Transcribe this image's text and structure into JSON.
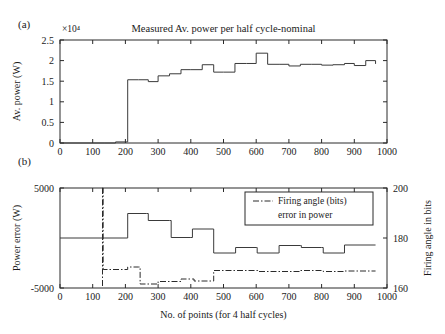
{
  "figure": {
    "panel_a_label": "(a)",
    "panel_b_label": "(b)"
  },
  "chart_data": [
    {
      "id": "panel_a",
      "type": "line",
      "title": "Measured Av. power per half cycle-nominal",
      "xlabel": "",
      "ylabel": "Av. power (W)",
      "y_exponent_label": "×10⁴",
      "xlim": [
        0,
        1000
      ],
      "ylim": [
        0,
        25000
      ],
      "xticks": [
        0,
        100,
        200,
        300,
        400,
        500,
        600,
        700,
        800,
        900,
        1000
      ],
      "xticklabels": [
        "0",
        "100",
        "200",
        "300",
        "400",
        "500",
        "600",
        "700",
        "800",
        "900",
        "1000"
      ],
      "yticks": [
        0,
        5000,
        10000,
        15000,
        20000,
        25000
      ],
      "yticklabels": [
        "0",
        "0.5",
        "1",
        "1.5",
        "2",
        "2.5"
      ],
      "grid": false,
      "legend": "none",
      "series": [
        {
          "name": "Measured Av. power",
          "style": "solid",
          "step": "post",
          "x": [
            0,
            135,
            170,
            205,
            207,
            240,
            270,
            300,
            335,
            370,
            400,
            435,
            470,
            500,
            535,
            570,
            600,
            635,
            670,
            700,
            735,
            770,
            800,
            835,
            870,
            900,
            935,
            965
          ],
          "y": [
            0,
            0,
            260,
            260,
            15350,
            15350,
            14900,
            16300,
            16800,
            17800,
            17800,
            19000,
            17200,
            17200,
            19300,
            19300,
            21800,
            19100,
            19100,
            18700,
            19100,
            19100,
            18900,
            19000,
            19300,
            18800,
            20000,
            19200
          ]
        }
      ]
    },
    {
      "id": "panel_b",
      "type": "line",
      "title": "",
      "xlabel": "No. of points (for 4 half cycles)",
      "ylabel": "Power error (W)",
      "ylabel_right": "Firing angle in bits",
      "xlim": [
        0,
        1000
      ],
      "ylim": [
        -5000,
        5000
      ],
      "ylim_right": [
        160,
        200
      ],
      "xticks": [
        0,
        100,
        200,
        300,
        400,
        500,
        600,
        700,
        800,
        900,
        1000
      ],
      "xticklabels": [
        "0",
        "100",
        "200",
        "300",
        "400",
        "500",
        "600",
        "700",
        "800",
        "900",
        "1000"
      ],
      "yticks": [
        -5000,
        5000
      ],
      "yticklabels": [
        "-5000",
        "5000"
      ],
      "yticks_right": [
        160,
        180,
        200
      ],
      "yticklabels_right": [
        "160",
        "180",
        "200"
      ],
      "grid": false,
      "legend": {
        "position": "top-right",
        "entries": [
          {
            "label_line1": "Firing angle (bits)",
            "label_line2": "error in power",
            "style": "dashdot"
          }
        ]
      },
      "series": [
        {
          "name": "error in power",
          "axis": "left",
          "style": "solid",
          "step": "post",
          "x": [
            0,
            135,
            205,
            207,
            265,
            270,
            335,
            340,
            400,
            405,
            468,
            470,
            535,
            537,
            600,
            603,
            668,
            670,
            735,
            738,
            800,
            805,
            868,
            870,
            965
          ],
          "y": [
            0,
            0,
            0,
            2450,
            2450,
            1750,
            1750,
            50,
            50,
            900,
            900,
            -1500,
            -1500,
            -950,
            -950,
            -1500,
            -1500,
            -750,
            -750,
            -950,
            -950,
            -1500,
            -1500,
            -700,
            -700
          ]
        },
        {
          "name": "Firing angle (bits)",
          "axis": "right",
          "style": "dashdot",
          "step": "post",
          "x": [
            130,
            132,
            205,
            207,
            240,
            245,
            275,
            300,
            340,
            370,
            405,
            410,
            468,
            470,
            535,
            600,
            605,
            668,
            735,
            805,
            868,
            900,
            965
          ],
          "y": [
            200,
            167.4,
            167.4,
            168.4,
            168.4,
            161.6,
            161.6,
            162.6,
            162.6,
            163.6,
            163.6,
            162.8,
            162.8,
            167.0,
            167.0,
            167.0,
            166.6,
            166.6,
            167.0,
            166.6,
            166.8,
            166.8,
            166.8
          ]
        }
      ],
      "vertical_marker": {
        "x": 130,
        "style": "dashdot"
      }
    }
  ]
}
